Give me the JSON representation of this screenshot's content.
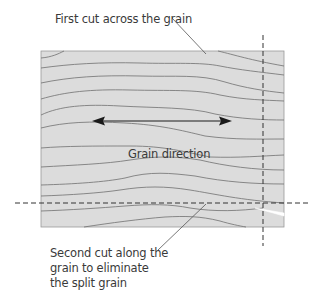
{
  "diagram": {
    "labels": {
      "first_cut": "First cut across the grain",
      "grain_direction": "Grain direction",
      "second_cut": "Second cut along the grain to eliminate the split grain"
    },
    "colors": {
      "board_fill": "#dcdcdc",
      "board_outline": "#9a9a9a",
      "grain_lines": "#707070",
      "cut_lines": "#333333",
      "text": "#3a3a3a",
      "split": "#ffffff"
    },
    "elements": {
      "board": "wood board with grain lines",
      "vertical_cut": "dashed line across the grain",
      "horizontal_cut": "dashed line along the grain",
      "arrow": "double-headed arrow showing grain direction",
      "split": "split in the grain at the board's right end"
    }
  }
}
